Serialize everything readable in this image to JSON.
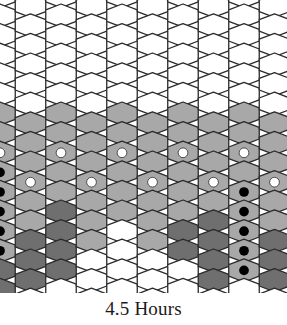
{
  "figure": {
    "caption": "4.5 Hours",
    "kind": "hexagonal-lattice-diagram",
    "width": 287,
    "height": 325
  },
  "palette": {
    "background": "#ffffff",
    "cell_empty": "#ffffff",
    "cell_light": "#a8a8a8",
    "cell_dark": "#6f6f6f",
    "edge": "#2b2b2b",
    "marker_open": "#ffffff",
    "marker_filled": "#000000",
    "caption_color": "#1a1a1a"
  },
  "grid": {
    "orientation": "pointy-top",
    "columns": 10,
    "rows": 16,
    "column_pitch": 30.5,
    "row_pitch": 19.6,
    "hex_radius": 11.6,
    "stagger": "odd-columns-offset-half-row",
    "stroke_width": 1.3
  },
  "legend": {
    "states": [
      {
        "name": "unoccupied",
        "fill": "#ffffff",
        "marker": "none"
      },
      {
        "name": "occupied-light",
        "fill": "#a8a8a8",
        "marker": "none"
      },
      {
        "name": "occupied-dark",
        "fill": "#6f6f6f",
        "marker": "none"
      },
      {
        "name": "marked-open",
        "fill": "#a8a8a8",
        "marker": "open-circle"
      },
      {
        "name": "marked-filled",
        "fill": "#a8a8a8",
        "marker": "filled-circle"
      }
    ]
  },
  "chart_data": {
    "type": "heatmap",
    "title": "4.5 Hours",
    "xlabel": "",
    "ylabel": "",
    "grid": true,
    "legend_position": "none",
    "columns": 10,
    "rows": 16,
    "state_codes": {
      "0": "empty",
      "1": "light",
      "2": "dark",
      "3": "light-with-open-marker",
      "4": "light-with-filled-marker",
      "5": "dark-with-filled-marker"
    },
    "cells": [
      [
        0,
        0,
        0,
        0,
        0,
        0,
        1,
        1,
        3,
        4,
        4,
        4,
        4,
        4,
        2,
        2
      ],
      [
        0,
        0,
        0,
        0,
        0,
        0,
        1,
        1,
        1,
        3,
        1,
        1,
        2,
        2,
        2,
        0
      ],
      [
        0,
        0,
        0,
        0,
        0,
        0,
        1,
        1,
        3,
        1,
        1,
        2,
        2,
        2,
        2,
        0
      ],
      [
        0,
        0,
        0,
        0,
        0,
        0,
        1,
        1,
        1,
        3,
        1,
        1,
        1,
        0,
        0,
        0
      ],
      [
        0,
        0,
        0,
        0,
        0,
        0,
        1,
        1,
        3,
        1,
        1,
        1,
        0,
        0,
        0,
        0
      ],
      [
        0,
        0,
        0,
        0,
        0,
        0,
        1,
        1,
        1,
        3,
        1,
        1,
        1,
        0,
        0,
        0
      ],
      [
        0,
        0,
        0,
        0,
        0,
        0,
        1,
        1,
        3,
        1,
        1,
        1,
        2,
        2,
        0,
        0
      ],
      [
        0,
        0,
        0,
        0,
        0,
        0,
        1,
        1,
        1,
        3,
        1,
        2,
        2,
        2,
        2,
        0
      ],
      [
        0,
        0,
        0,
        0,
        0,
        0,
        1,
        1,
        3,
        1,
        4,
        4,
        4,
        4,
        4,
        0
      ],
      [
        0,
        0,
        0,
        0,
        0,
        0,
        1,
        1,
        1,
        3,
        1,
        1,
        2,
        2,
        2,
        0
      ],
      [
        0,
        0,
        0,
        0,
        0,
        0,
        1,
        1,
        3,
        1,
        1,
        2,
        2,
        2,
        0,
        0
      ],
      [
        0,
        0,
        0,
        0,
        0,
        0,
        1,
        1,
        1,
        3,
        1,
        1,
        1,
        0,
        0,
        0
      ],
      [
        0,
        0,
        0,
        0,
        0,
        0,
        1,
        1,
        3,
        1,
        1,
        1,
        1,
        0,
        0,
        0
      ],
      [
        0,
        0,
        0,
        0,
        0,
        0,
        1,
        1,
        1,
        3,
        1,
        1,
        0,
        0,
        0,
        0
      ],
      [
        0,
        0,
        0,
        0,
        0,
        0,
        1,
        1,
        3,
        1,
        1,
        1,
        0,
        0,
        0,
        0
      ],
      [
        0,
        0,
        0,
        0,
        0,
        0,
        1,
        1,
        1,
        3,
        1,
        1,
        0,
        0,
        0,
        0
      ]
    ]
  }
}
